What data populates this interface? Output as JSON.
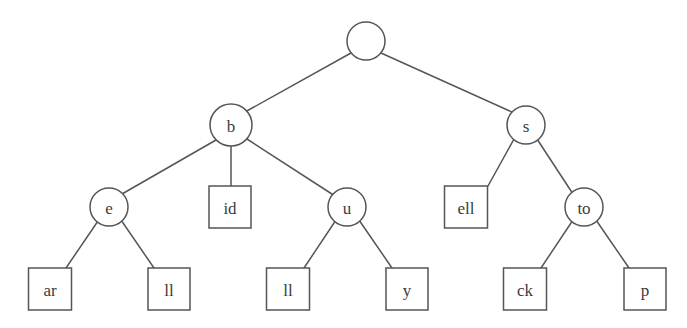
{
  "diagram": {
    "kind": "trie-tree-diagram",
    "background_color": "#ffffff",
    "stroke_color": "#55555a",
    "text_color": "#3b3b40",
    "canvas": {
      "width": 687,
      "height": 328
    },
    "nodes": [
      {
        "id": "root",
        "label": "",
        "shape": "circle",
        "cx": 366,
        "cy": 41,
        "r": 19,
        "level": 0
      },
      {
        "id": "b",
        "label": "b",
        "shape": "circle",
        "cx": 231,
        "cy": 125,
        "r": 21,
        "level": 1
      },
      {
        "id": "s",
        "label": "s",
        "shape": "circle",
        "cx": 526,
        "cy": 125,
        "r": 19,
        "level": 1
      },
      {
        "id": "e",
        "label": "e",
        "shape": "circle",
        "cx": 109,
        "cy": 207,
        "r": 19,
        "level": 2
      },
      {
        "id": "id",
        "label": "id",
        "shape": "box",
        "cx": 230,
        "cy": 207,
        "w": 42,
        "h": 42,
        "level": 2
      },
      {
        "id": "u",
        "label": "u",
        "shape": "circle",
        "cx": 347,
        "cy": 207,
        "r": 19,
        "level": 2
      },
      {
        "id": "ell",
        "label": "ell",
        "shape": "box",
        "cx": 466,
        "cy": 207,
        "w": 43,
        "h": 42,
        "level": 2
      },
      {
        "id": "to",
        "label": "to",
        "shape": "circle",
        "cx": 584,
        "cy": 207,
        "r": 19,
        "level": 2
      },
      {
        "id": "ar",
        "label": "ar",
        "shape": "box",
        "cx": 50,
        "cy": 289,
        "w": 43,
        "h": 42,
        "level": 3
      },
      {
        "id": "ll1",
        "label": "ll",
        "shape": "box",
        "cx": 169,
        "cy": 289,
        "w": 42,
        "h": 42,
        "level": 3
      },
      {
        "id": "ll2",
        "label": "ll",
        "shape": "box",
        "cx": 288,
        "cy": 289,
        "w": 43,
        "h": 42,
        "level": 3
      },
      {
        "id": "y",
        "label": "y",
        "shape": "box",
        "cx": 407,
        "cy": 289,
        "w": 42,
        "h": 42,
        "level": 3
      },
      {
        "id": "ck",
        "label": "ck",
        "shape": "box",
        "cx": 525,
        "cy": 289,
        "w": 43,
        "h": 42,
        "level": 3
      },
      {
        "id": "p",
        "label": "p",
        "shape": "box",
        "cx": 645,
        "cy": 289,
        "w": 42,
        "h": 42,
        "level": 3
      }
    ],
    "edges": [
      {
        "id": "root-b",
        "from": "root",
        "to": "b",
        "x1": 351,
        "y1": 53,
        "x2": 245,
        "y2": 112
      },
      {
        "id": "root-s",
        "from": "root",
        "to": "s",
        "x1": 381,
        "y1": 53,
        "x2": 514,
        "y2": 113
      },
      {
        "id": "b-e",
        "from": "b",
        "to": "e",
        "x1": 216,
        "y1": 140,
        "x2": 122,
        "y2": 194
      },
      {
        "id": "b-id",
        "from": "b",
        "to": "id",
        "x1": 231,
        "y1": 146,
        "x2": 231,
        "y2": 186
      },
      {
        "id": "b-u",
        "from": "b",
        "to": "u",
        "x1": 247,
        "y1": 139,
        "x2": 335,
        "y2": 196
      },
      {
        "id": "s-ell",
        "from": "s",
        "to": "ell",
        "x1": 514,
        "y1": 139,
        "x2": 488,
        "y2": 186
      },
      {
        "id": "s-to",
        "from": "s",
        "to": "to",
        "x1": 537,
        "y1": 139,
        "x2": 573,
        "y2": 194
      },
      {
        "id": "e-ar",
        "from": "e",
        "to": "ar",
        "x1": 98,
        "y1": 221,
        "x2": 66,
        "y2": 268
      },
      {
        "id": "e-ll1",
        "from": "e",
        "to": "ll1",
        "x1": 121,
        "y1": 220,
        "x2": 154,
        "y2": 268
      },
      {
        "id": "u-ll2",
        "from": "u",
        "to": "ll2",
        "x1": 336,
        "y1": 220,
        "x2": 304,
        "y2": 268
      },
      {
        "id": "u-y",
        "from": "u",
        "to": "y",
        "x1": 359,
        "y1": 220,
        "x2": 392,
        "y2": 268
      },
      {
        "id": "to-ck",
        "from": "to",
        "to": "ck",
        "x1": 573,
        "y1": 220,
        "x2": 541,
        "y2": 268
      },
      {
        "id": "to-p",
        "from": "to",
        "to": "p",
        "x1": 596,
        "y1": 220,
        "x2": 629,
        "y2": 268
      }
    ]
  }
}
